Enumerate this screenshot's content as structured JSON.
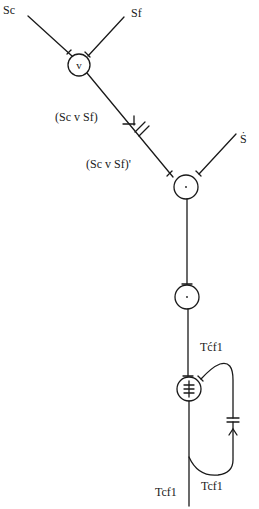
{
  "diagram": {
    "labels": {
      "sc": "Sc",
      "sf": "Sf",
      "sc_or_sf": "(Sc v Sf)",
      "sc_or_sf_prime": "(Sc v Sf)'",
      "s_dot": "Ṡ",
      "tcf1_prime": "Tćf1",
      "tcf1_loop": "Tcf1",
      "tcf1_out": "Tcf1"
    },
    "nodes": [
      {
        "id": "or-node",
        "symbol": "v"
      },
      {
        "id": "and-node-1",
        "symbol": "·"
      },
      {
        "id": "and-node-2",
        "symbol": "·"
      },
      {
        "id": "triple-bar-node",
        "symbol": "≢"
      }
    ],
    "colors": {
      "stroke": "#1a1a1a",
      "background": "#ffffff"
    }
  }
}
